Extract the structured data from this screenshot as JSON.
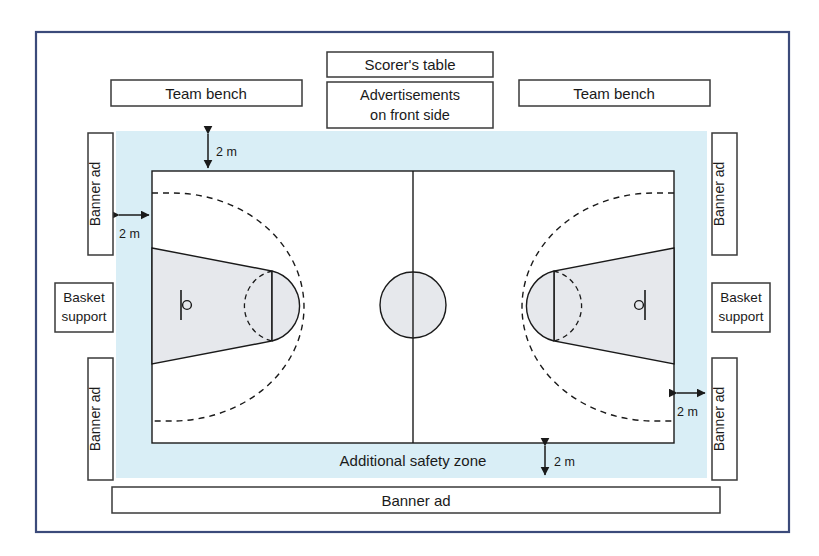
{
  "diagram": {
    "colors": {
      "frame_border": "#3b4a7a",
      "safety_zone_fill": "#d9eef6",
      "court_fill": "#ffffff",
      "key_fill": "#e6e8ec",
      "line": "#1a1a1a",
      "box_fill": "#ffffff",
      "box_border": "#3a3a3a",
      "text": "#1a1a1a"
    },
    "top_boxes": [
      {
        "id": "team-bench-left",
        "label": "Team bench"
      },
      {
        "id": "scorers-table",
        "label": "Scorer's table"
      },
      {
        "id": "advertisements-front",
        "label": "Advertisements\non front side",
        "line1": "Advertisements",
        "line2": "on front side"
      },
      {
        "id": "team-bench-right",
        "label": "Team bench"
      }
    ],
    "side_boxes_left": [
      {
        "id": "banner-ad-left-top",
        "label": "Banner ad",
        "orientation": "vertical"
      },
      {
        "id": "basket-support-left",
        "label": "Basket support",
        "line1": "Basket",
        "line2": "support",
        "orientation": "horizontal"
      },
      {
        "id": "banner-ad-left-bottom",
        "label": "Banner ad",
        "orientation": "vertical"
      }
    ],
    "side_boxes_right": [
      {
        "id": "banner-ad-right-top",
        "label": "Banner ad",
        "orientation": "vertical"
      },
      {
        "id": "basket-support-right",
        "label": "Basket support",
        "line1": "Basket",
        "line2": "support",
        "orientation": "horizontal"
      },
      {
        "id": "banner-ad-right-bottom",
        "label": "Banner ad",
        "orientation": "vertical"
      }
    ],
    "bottom_boxes": [
      {
        "id": "banner-ad-bottom",
        "label": "Banner ad"
      }
    ],
    "zone_label": "Additional safety zone",
    "dimensions": [
      {
        "id": "dim-top",
        "label": "2 m",
        "position": "top",
        "meaning": "safety zone depth above end line"
      },
      {
        "id": "dim-left",
        "label": "2 m",
        "position": "left",
        "meaning": "safety zone depth left of side line"
      },
      {
        "id": "dim-right",
        "label": "2 m",
        "position": "right",
        "meaning": "safety zone depth right of side line"
      },
      {
        "id": "dim-bottom",
        "label": "2 m",
        "position": "bottom",
        "meaning": "safety zone depth below end line"
      }
    ],
    "court_features": [
      {
        "id": "center-line",
        "label": "Center line"
      },
      {
        "id": "center-circle",
        "label": "Center circle"
      },
      {
        "id": "three-point-line-left",
        "label": "Three-point line"
      },
      {
        "id": "three-point-line-right",
        "label": "Three-point line"
      },
      {
        "id": "restricted-area-left",
        "label": "Restricted area (key)"
      },
      {
        "id": "restricted-area-right",
        "label": "Restricted area (key)"
      },
      {
        "id": "free-throw-circle-left",
        "label": "Free-throw circle"
      },
      {
        "id": "free-throw-circle-right",
        "label": "Free-throw circle"
      },
      {
        "id": "basket-left",
        "label": "Basket and backboard"
      },
      {
        "id": "basket-right",
        "label": "Basket and backboard"
      }
    ]
  }
}
